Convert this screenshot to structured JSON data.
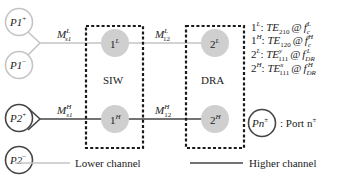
{
  "colors": {
    "lower_channel": "#c4c4c4",
    "higher_channel": "#444444",
    "resonator_fill": "#cfcfcf",
    "dashed_box": "#1a1a1a"
  },
  "ports": {
    "p1_plus": {
      "name": "P1",
      "sup": "+"
    },
    "p1_minus": {
      "name": "P1",
      "sup": "−"
    },
    "p2_plus": {
      "name": "P2",
      "sup": "+"
    },
    "p2_minus": {
      "name": "P2",
      "sup": "−"
    }
  },
  "couplings": {
    "ms1_lower": {
      "main": "M",
      "sup": "L",
      "sub": "s1"
    },
    "ms1_higher": {
      "main": "M",
      "sup": "H",
      "sub": "s1"
    },
    "m12_lower": {
      "main": "M",
      "sup": "L",
      "sub": "12"
    },
    "m12_higher": {
      "main": "M",
      "sup": "H",
      "sub": "12"
    }
  },
  "resonators": {
    "r1_lower": {
      "num": "1",
      "sup": "L"
    },
    "r1_higher": {
      "num": "1",
      "sup": "H"
    },
    "r2_lower": {
      "num": "2",
      "sup": "L"
    },
    "r2_higher": {
      "num": "2",
      "sup": "H"
    }
  },
  "boxes": {
    "siw": "SIW",
    "dra": "DRA"
  },
  "modes": [
    {
      "res": "1",
      "res_sup": "L",
      "mode": "TE",
      "mode_sub": "210",
      "mode_sup": "",
      "at": "@",
      "freq": "f",
      "freq_sub": "c",
      "freq_sup": "L"
    },
    {
      "res": "1",
      "res_sup": "H",
      "mode": "TE",
      "mode_sub": "120",
      "mode_sup": "",
      "at": "@",
      "freq": "f",
      "freq_sub": "c",
      "freq_sup": "H"
    },
    {
      "res": "2",
      "res_sup": "L",
      "mode": "TE",
      "mode_sub": "111",
      "mode_sup": "y",
      "at": "@",
      "freq": "f",
      "freq_sub": "DR",
      "freq_sup": "L"
    },
    {
      "res": "2",
      "res_sup": "H",
      "mode": "TE",
      "mode_sub": "111",
      "mode_sup": "x",
      "at": "@",
      "freq": "f",
      "freq_sub": "DR",
      "freq_sup": "H"
    }
  ],
  "port_legend": {
    "name": "Pn",
    "sup": "±",
    "desc": ": Port n",
    "desc_sup": "±"
  },
  "legend": {
    "lower": "Lower channel",
    "higher": "Higher channel"
  }
}
